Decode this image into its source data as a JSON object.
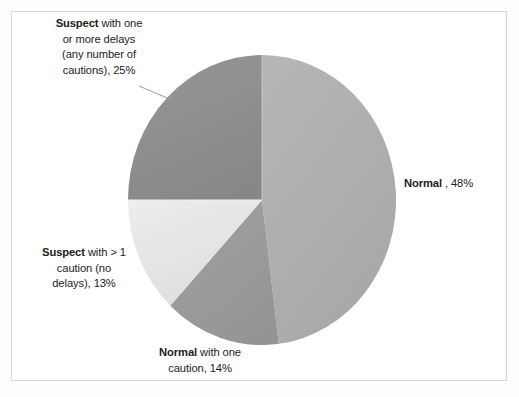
{
  "chart_data": {
    "type": "pie",
    "title": "",
    "subtitle": "",
    "xlabel": "",
    "ylabel": "",
    "legend_position": "none",
    "grid": false,
    "labels_position": "outside",
    "start_angle_deg": 0,
    "direction": "clockwise",
    "categories": [
      "Normal",
      "Normal with one caution",
      "Suspect with > 1 caution (no delays)",
      "Suspect with one or more delays (any number of cautions)"
    ],
    "values": [
      48,
      14,
      13,
      25
    ],
    "unit": "%",
    "total": 100,
    "slices": [
      {
        "name": "Normal",
        "value": 48,
        "label_text": "Normal , 48%",
        "label_bold_prefix": "Normal",
        "label_rest": " , 48%",
        "color": "#b0b0b0",
        "start_deg": 0,
        "end_deg": 172.8
      },
      {
        "name": "Normal with one caution",
        "value": 14,
        "label_text": "Normal with one caution, 14%",
        "label_bold_prefix": "Normal",
        "label_rest": " with one caution, 14%",
        "color": "#9a9a9a",
        "start_deg": 172.8,
        "end_deg": 223.2
      },
      {
        "name": "Suspect with > 1 caution (no delays)",
        "value": 13,
        "label_text": "Suspect with > 1 caution (no delays), 13%",
        "label_bold_prefix": "Suspect",
        "label_rest": " with > 1 caution (no delays), 13%",
        "color": "#e6e6e6",
        "start_deg": 223.2,
        "end_deg": 270.0
      },
      {
        "name": "Suspect with one or more delays (any number of cautions)",
        "value": 25,
        "label_text": "Suspect with one or more delays (any number of cautions), 25%",
        "label_bold_prefix": "Suspect",
        "label_rest": " with one or more delays (any number of cautions), 25%",
        "color": "#8e8e8e",
        "start_deg": 270.0,
        "end_deg": 360.0
      }
    ]
  },
  "labels": {
    "suspect_delays": {
      "bold": "Suspect",
      "line1_rest": " with one",
      "line2": "or more delays",
      "line3": "(any number of",
      "line4": "cautions), 25%",
      "percent": "25%"
    },
    "normal": {
      "bold": "Normal",
      "rest": " , 48%",
      "percent": "48%"
    },
    "suspect_cautions": {
      "bold": "Suspect",
      "line1_rest": " with > 1",
      "line2": "caution (no",
      "line3": "delays), 13%",
      "percent": "13%"
    },
    "normal_caution": {
      "bold": "Normal",
      "line1_rest": " with one",
      "line2": "caution, 14%",
      "percent": "14%"
    }
  },
  "colors": {
    "slice_normal": "#b0b0b0",
    "slice_normal_caution": "#9a9a9a",
    "slice_suspect_cautions": "#e6e6e6",
    "slice_suspect_delays": "#8e8e8e",
    "frame_border": "#d6d6d6",
    "text": "#1c1c1c",
    "leader_line": "#9b9b9b",
    "background": "#ffffff"
  }
}
